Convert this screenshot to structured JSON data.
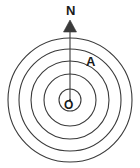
{
  "figure": {
    "background_color": "#ffffff",
    "stroke_color": "#3a3a3a",
    "label_color": "#1a1a1a",
    "width": 140,
    "height": 168
  },
  "labels": {
    "north": "N",
    "point_a": "A",
    "origin": "O"
  },
  "chart_data": {
    "type": "diagram",
    "center": {
      "x": 70,
      "y": 100,
      "label": "O"
    },
    "circles": [
      {
        "index": 1,
        "radius": 11
      },
      {
        "index": 2,
        "radius": 26
      },
      {
        "index": 3,
        "radius": 39
      },
      {
        "index": 4,
        "radius": 51
      },
      {
        "index": 5,
        "radius": 62
      }
    ],
    "arrow": {
      "label": "N",
      "from": {
        "x": 70,
        "y": 100
      },
      "to": {
        "x": 70,
        "y": 22
      },
      "direction": "up",
      "head": "solid-triangle"
    },
    "points": [
      {
        "label": "A",
        "x": 92,
        "y": 62
      }
    ],
    "grid": false,
    "legend": false
  }
}
